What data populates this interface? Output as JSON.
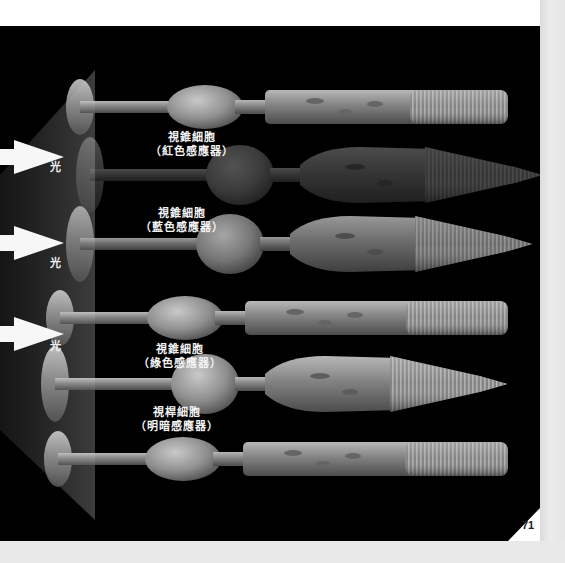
{
  "page": {
    "page_number": "71",
    "background": "#000000",
    "margin_color": "#e9e9e9"
  },
  "light": {
    "label": "光",
    "arrows": [
      {
        "y": 157,
        "label_x": 50,
        "label_y": 166
      },
      {
        "y": 243,
        "label_x": 50,
        "label_y": 262
      },
      {
        "y": 334,
        "label_x": 50,
        "label_y": 345
      }
    ]
  },
  "labels": [
    {
      "id": "red-cone",
      "line1": "視錐細胞",
      "line2": "（紅色感應器）",
      "x": 150,
      "y": 131
    },
    {
      "id": "blue-cone",
      "line1": "視錐細胞",
      "line2": "（藍色感應器）",
      "x": 140,
      "y": 207
    },
    {
      "id": "green-cone",
      "line1": "視錐細胞",
      "line2": "（綠色感應器）",
      "x": 138,
      "y": 343
    },
    {
      "id": "rod",
      "line1": "視桿細胞",
      "line2": "（明暗感應器）",
      "x": 135,
      "y": 406
    }
  ],
  "cells": [
    {
      "type": "rod",
      "cy": 107,
      "base_x": 80,
      "shade": 0.85
    },
    {
      "type": "cone",
      "cy": 175,
      "base_x": 90,
      "shade": 0.35
    },
    {
      "type": "cone",
      "cy": 244,
      "base_x": 80,
      "shade": 0.7
    },
    {
      "type": "rod",
      "cy": 318,
      "base_x": 60,
      "shade": 0.85
    },
    {
      "type": "cone",
      "cy": 384,
      "base_x": 55,
      "shade": 0.85
    },
    {
      "type": "rod",
      "cy": 459,
      "base_x": 58,
      "shade": 0.85
    }
  ]
}
